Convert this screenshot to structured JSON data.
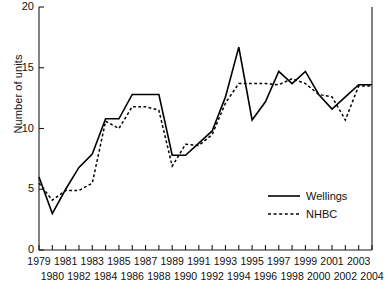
{
  "chart_data": {
    "type": "line",
    "title": "",
    "xlabel": "",
    "ylabel": "Number of units",
    "ylim": [
      0,
      20
    ],
    "yticks": [
      0,
      5,
      10,
      15,
      20
    ],
    "grid": false,
    "legend_position": "bottom-right",
    "x": [
      1979,
      1980,
      1981,
      1982,
      1983,
      1984,
      1985,
      1986,
      1987,
      1988,
      1989,
      1990,
      1991,
      1992,
      1993,
      1994,
      1995,
      1996,
      1997,
      1998,
      1999,
      2000,
      2001,
      2002,
      2003,
      2004
    ],
    "categories": [
      "1979",
      "1980",
      "1981",
      "1982",
      "1983",
      "1984",
      "1985",
      "1986",
      "1987",
      "1988",
      "1989",
      "1990",
      "1991",
      "1992",
      "1993",
      "1994",
      "1995",
      "1996",
      "1997",
      "1998",
      "1999",
      "2000",
      "2001",
      "2002",
      "2003",
      "2004"
    ],
    "series": [
      {
        "name": "Wellings",
        "style": "solid",
        "color": "#000000",
        "values": [
          6.0,
          3.0,
          5.0,
          6.8,
          7.9,
          10.8,
          10.8,
          12.8,
          12.8,
          12.8,
          7.8,
          7.8,
          8.8,
          9.8,
          12.6,
          16.7,
          10.7,
          12.2,
          14.7,
          13.7,
          14.7,
          12.8,
          11.6,
          12.6,
          13.6,
          13.6
        ]
      },
      {
        "name": "NHBC",
        "style": "dotted",
        "color": "#000000",
        "values": [
          5.5,
          4.1,
          4.9,
          4.9,
          5.5,
          10.6,
          10.0,
          11.8,
          11.8,
          11.5,
          6.9,
          8.7,
          8.6,
          9.5,
          12.1,
          13.7,
          13.7,
          13.7,
          13.6,
          14.1,
          13.7,
          12.8,
          12.6,
          10.7,
          13.5,
          13.5
        ]
      }
    ]
  },
  "axis": {
    "ytick_labels": [
      "0",
      "5",
      "10",
      "15",
      "20"
    ],
    "xtick_labels_top": [
      "1979",
      "1981",
      "1983",
      "1985",
      "1987",
      "1989",
      "1991",
      "1993",
      "1995",
      "1997",
      "1999",
      "2001",
      "2003"
    ],
    "xtick_labels_bottom": [
      "1980",
      "1982",
      "1984",
      "1986",
      "1988",
      "1990",
      "1992",
      "1994",
      "1996",
      "1998",
      "2000",
      "2002",
      "2004"
    ]
  },
  "legend": {
    "entries": [
      {
        "label": "Wellings",
        "style": "solid"
      },
      {
        "label": "NHBC",
        "style": "dotted"
      }
    ]
  },
  "colors": {
    "axis": "#1a1a1a",
    "series": "#000000",
    "background": "#ffffff"
  }
}
